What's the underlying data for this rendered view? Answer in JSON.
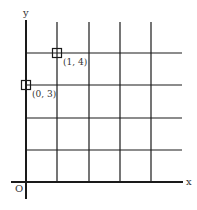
{
  "diagram": {
    "type": "coordinate-grid",
    "axes": {
      "x_label": "x",
      "y_label": "y",
      "origin_label": "O"
    },
    "grid": {
      "columns": 5,
      "rows": 4
    },
    "points": [
      {
        "x": 1,
        "y": 4,
        "label": "(1, 4)"
      },
      {
        "x": 0,
        "y": 3,
        "label": "(0, 3)"
      }
    ],
    "colors": {
      "line": "#1a1a1a",
      "text": "#333333",
      "background": "#ffffff"
    }
  }
}
